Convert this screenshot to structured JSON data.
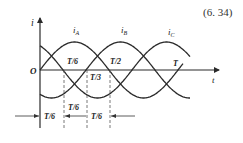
{
  "equation_number": "(6. 34)",
  "axes": {
    "y_label": "i",
    "x_label": "t",
    "origin_label": "O"
  },
  "curves": [
    {
      "name": "i_A",
      "label_main": "i",
      "label_sub": "A",
      "phase_deg": 0
    },
    {
      "name": "i_B",
      "label_main": "i",
      "label_sub": "B",
      "phase_deg": -120
    },
    {
      "name": "i_C",
      "label_main": "i",
      "label_sub": "C",
      "phase_deg": 120
    }
  ],
  "annotations": {
    "t6_upper": "T/6",
    "t3": "T/3",
    "t2": "T/2",
    "T": "T"
  },
  "dimensions": {
    "first": "T/6",
    "second": "T/6",
    "third": "T/6"
  },
  "colors": {
    "line": "#2a2a2a",
    "background": "#ffffff"
  }
}
